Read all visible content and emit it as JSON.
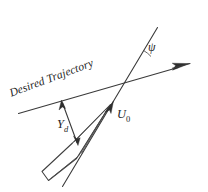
{
  "figure": {
    "type": "diagram",
    "background_color": "#ffffff",
    "line_color": "#3a3a3a",
    "text_color": "#262626",
    "width": 208,
    "height": 192
  },
  "labels": {
    "desired_trajectory": "Desired Trajectory",
    "heading_angle": "ψ",
    "surge_velocity": "U",
    "surge_velocity_sub": "0",
    "cross_track_error": "Y",
    "cross_track_error_sub": "d"
  },
  "elements": {
    "trajectory_line_name": "desired-trajectory-line",
    "heading_line_name": "heading-vector-line",
    "hull_name": "ship-hull",
    "angle_arc_name": "heading-angle-arc",
    "yd_arrow_name": "cross-track-error-arrow",
    "u0_arrow_name": "surge-velocity-arrow",
    "trajectory_arrowhead_name": "trajectory-arrowhead"
  },
  "geometry": {
    "trajectory_start": [
      18,
      113
    ],
    "trajectory_end": [
      200,
      61
    ],
    "trajectory_angle_deg": -16.0,
    "heading_start": [
      62,
      186
    ],
    "heading_end": [
      158,
      27
    ],
    "heading_angle_deg": -58.9,
    "intersection": [
      128,
      78
    ],
    "psi_angle_deg": 43,
    "hull_bow": [
      110,
      104
    ],
    "hull_stern_center": [
      56,
      178
    ],
    "yd_arrow_start": [
      62,
      102
    ],
    "yd_arrow_end": [
      77,
      143
    ],
    "u0_arrow_tip": [
      112,
      103
    ]
  }
}
